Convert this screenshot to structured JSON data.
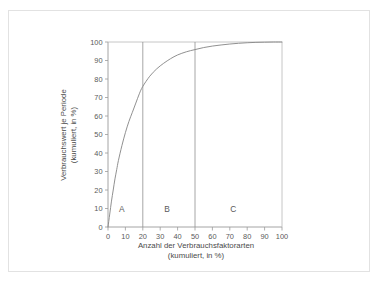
{
  "figure": {
    "background_color": "#ffffff",
    "frame_color": "#e2e2e2",
    "line_color": "#8a8a8a",
    "text_color": "#555555"
  },
  "chart_data": {
    "type": "line",
    "title": "",
    "subtitle": "",
    "xlabel": "Anzahl der Verbrauchsfaktorarten",
    "xlabel_line2": "(kumuliert, in %)",
    "ylabel": "Verbrauchswert je Periode",
    "ylabel_line2": "(kumuliert, in %)",
    "xlim": [
      0,
      100
    ],
    "ylim": [
      0,
      100
    ],
    "xticks": [
      0,
      10,
      20,
      30,
      40,
      50,
      60,
      70,
      80,
      90,
      100
    ],
    "yticks": [
      0,
      10,
      20,
      30,
      40,
      50,
      60,
      70,
      80,
      90,
      100
    ],
    "xticklabels": [
      "0",
      "10",
      "20",
      "30",
      "40",
      "50",
      "60",
      "70",
      "80",
      "90",
      "100"
    ],
    "yticklabels": [
      "0",
      "10",
      "20",
      "30",
      "40",
      "50",
      "60",
      "70",
      "80",
      "90",
      "100"
    ],
    "grid": false,
    "legend": false,
    "legend_position": "none",
    "series": [
      {
        "name": "Lorenzkurve",
        "color": "#8a8a8a",
        "x": [
          0,
          1,
          2,
          3,
          4,
          5,
          6,
          8,
          10,
          12,
          14,
          16,
          18,
          20,
          24,
          28,
          32,
          36,
          40,
          45,
          50,
          55,
          60,
          65,
          70,
          75,
          80,
          85,
          90,
          95,
          100
        ],
        "values": [
          0,
          7,
          14,
          20,
          26,
          31,
          36,
          44,
          51,
          57,
          62,
          67,
          72,
          76,
          81.5,
          85.5,
          88.5,
          91,
          93,
          94.7,
          95.9,
          97,
          97.8,
          98.4,
          98.9,
          99.3,
          99.6,
          99.8,
          99.9,
          100,
          100
        ]
      }
    ],
    "dividers": [
      {
        "name": "divider-a-b",
        "x": 20
      },
      {
        "name": "divider-b-c",
        "x": 50
      }
    ],
    "zones": [
      {
        "name": "zone-a",
        "label": "A",
        "x_start": 0,
        "x_end": 20,
        "label_x": 8,
        "label_y": 10
      },
      {
        "name": "zone-b",
        "label": "B",
        "x_start": 20,
        "x_end": 50,
        "label_x": 34,
        "label_y": 10
      },
      {
        "name": "zone-c",
        "label": "C",
        "x_start": 50,
        "x_end": 100,
        "label_x": 72,
        "label_y": 10
      }
    ],
    "annotations": [
      {
        "text": "A",
        "x": 8,
        "y": 10
      },
      {
        "text": "B",
        "x": 34,
        "y": 10
      },
      {
        "text": "C",
        "x": 72,
        "y": 10
      }
    ]
  }
}
